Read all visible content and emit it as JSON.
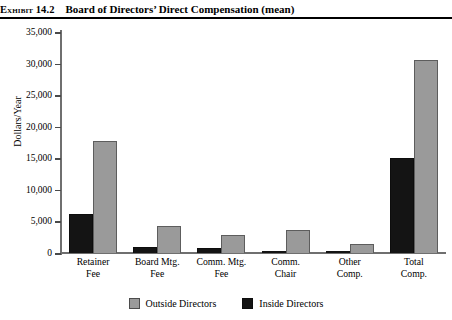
{
  "exhibit": {
    "label": "Exhibit 14.2",
    "title": "Board of Directors’ Direct Compensation (mean)"
  },
  "chart_data": {
    "type": "bar",
    "title": "Board of Directors’ Direct Compensation (mean)",
    "xlabel": "",
    "ylabel": "Dollars/Year",
    "ylim": [
      0,
      35000
    ],
    "yticks": [
      0,
      5000,
      10000,
      15000,
      20000,
      25000,
      30000,
      35000
    ],
    "ytick_labels": [
      "0",
      "5,000",
      "10,000",
      "15,000",
      "20,000",
      "25,000",
      "30,000",
      "35,000"
    ],
    "grid": false,
    "legend_position": "bottom",
    "categories": [
      "Retainer Fee",
      "Board Mtg. Fee",
      "Comm. Mtg. Fee",
      "Comm. Chair",
      "Other Comp.",
      "Total Comp."
    ],
    "category_lines": [
      [
        "Retainer",
        "Fee"
      ],
      [
        "Board Mtg.",
        "Fee"
      ],
      [
        "Comm. Mtg.",
        "Fee"
      ],
      [
        "Comm.",
        "Chair"
      ],
      [
        "Other",
        "Comp."
      ],
      [
        "Total",
        "Comp."
      ]
    ],
    "series": [
      {
        "name": "Inside Directors",
        "color": "#141414",
        "values": [
          6200,
          900,
          800,
          300,
          300,
          15100
        ]
      },
      {
        "name": "Outside Directors",
        "color": "#9a9a9a",
        "values": [
          17700,
          4200,
          2800,
          3700,
          1400,
          30500
        ]
      }
    ],
    "legend": [
      {
        "label": "Outside Directors",
        "swatch": "outside"
      },
      {
        "label": "Inside Directors",
        "swatch": "inside"
      }
    ]
  }
}
